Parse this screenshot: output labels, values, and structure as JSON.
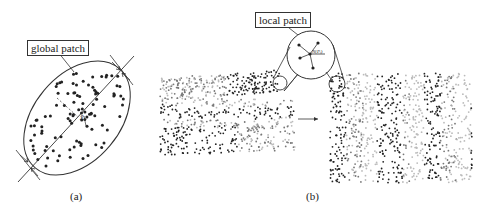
{
  "panel_a": {
    "caption": "(a)",
    "callout_label": "global patch",
    "center_symbol": "x̄"
  },
  "panel_b": {
    "caption": "(b)",
    "callout_label": "local patch",
    "node_label": "N(Pᵢ)"
  },
  "colors": {
    "line": "#333333",
    "point_dark": "#222222",
    "point_mid": "#777777",
    "point_light": "#bbbbbb",
    "background": "#ffffff"
  }
}
